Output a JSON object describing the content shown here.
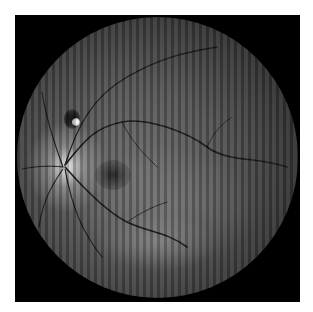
{
  "image": {
    "description": "Grayscale fundus photograph of a retina with vertical stripe artifacts",
    "background_color": "#ffffff",
    "frame_color": "#000000",
    "features": [
      "optic-disc",
      "macula",
      "retinal-vessels",
      "dark-lesion",
      "bright-spot"
    ]
  }
}
